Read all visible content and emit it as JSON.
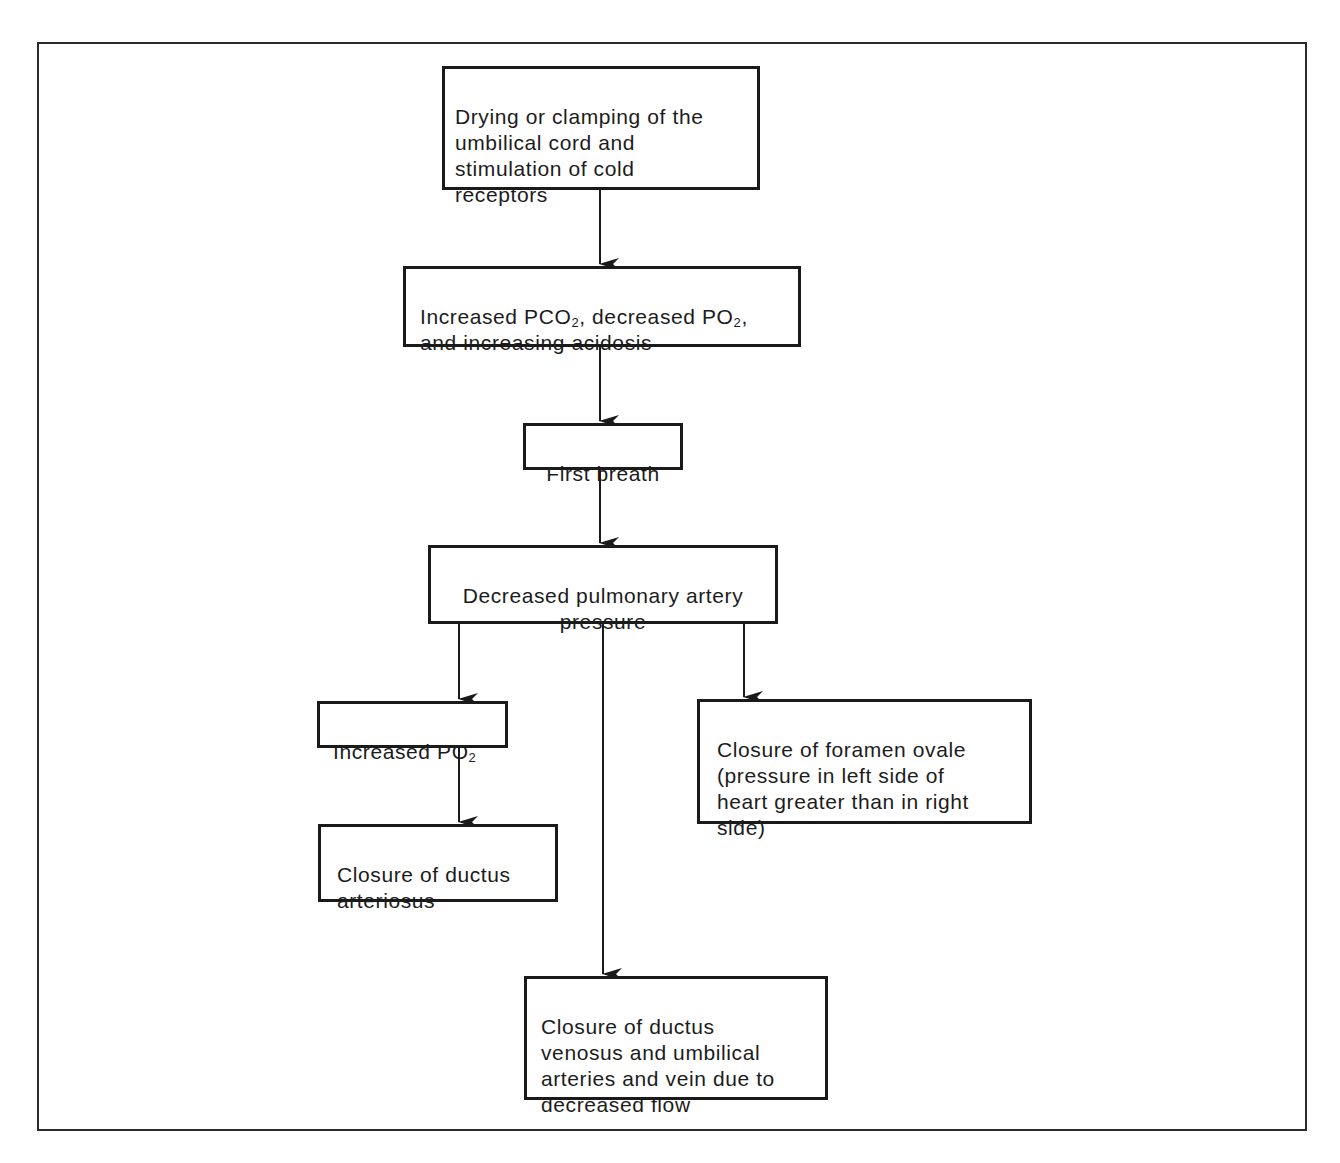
{
  "diagram": {
    "type": "flowchart",
    "nodes": [
      {
        "id": "n1",
        "text": "Drying or clamping of the\numbilical cord and\nstimulation of cold\nreceptors"
      },
      {
        "id": "n2",
        "text_parts": [
          "Increased PCO",
          "2",
          ", decreased PO",
          "2",
          ",\nand increasing acidosis"
        ]
      },
      {
        "id": "n3",
        "text": "First breath"
      },
      {
        "id": "n4",
        "text": "Decreased pulmonary artery\npressure"
      },
      {
        "id": "n5",
        "text_parts": [
          "Increased PO",
          "2"
        ]
      },
      {
        "id": "n6",
        "text": "Closure of ductus\narteriosus"
      },
      {
        "id": "n7",
        "text": "Closure of foramen ovale\n(pressure in left side of\nheart greater than in right\nside)"
      },
      {
        "id": "n8",
        "text": "Closure of ductus\nvenosus and umbilical\narteries and vein due to\ndecreased flow"
      }
    ],
    "edges": [
      {
        "from": "n1",
        "to": "n2"
      },
      {
        "from": "n2",
        "to": "n3"
      },
      {
        "from": "n3",
        "to": "n4"
      },
      {
        "from": "n4",
        "to": "n5"
      },
      {
        "from": "n4",
        "to": "n7"
      },
      {
        "from": "n4",
        "to": "n8"
      },
      {
        "from": "n5",
        "to": "n6"
      }
    ]
  },
  "nodes": {
    "n1": {
      "text": "Drying or clamping of the\numbilical cord and\nstimulation of cold\nreceptors"
    },
    "n2": {
      "a": "Increased PCO",
      "sub1": "2",
      "b": ", decreased PO",
      "sub2": "2",
      "c": ",\nand increasing acidosis"
    },
    "n3": {
      "text": "First breath"
    },
    "n4": {
      "text": "Decreased pulmonary artery\npressure"
    },
    "n5": {
      "a": "Increased PO",
      "sub1": "2"
    },
    "n6": {
      "text": "Closure of ductus\narteriosus"
    },
    "n7": {
      "text": "Closure of foramen ovale\n(pressure in left side of\nheart greater than in right\nside)"
    },
    "n8": {
      "text": "Closure of ductus\nvenosus and umbilical\narteries and vein due to\ndecreased flow"
    }
  },
  "colors": {
    "line": "#1a1a1a",
    "text": "#1c1c1c",
    "background": "#ffffff"
  }
}
